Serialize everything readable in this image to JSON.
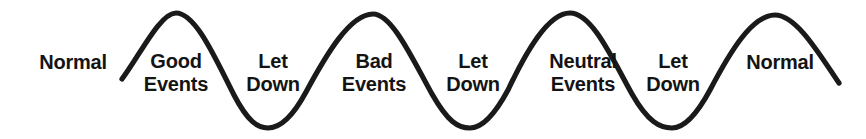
{
  "diagram": {
    "background_color": "#ffffff",
    "stroke_color": "#1a1a1a",
    "text_color": "#141414",
    "labels": [
      {
        "id": "normal-start",
        "lines": [
          "Normal"
        ],
        "x": 73,
        "y": 51,
        "position": "baseline-left"
      },
      {
        "id": "good-events",
        "lines": [
          "Good",
          "Events"
        ],
        "x": 176,
        "y": 50,
        "position": "peak-1"
      },
      {
        "id": "let-down-1",
        "lines": [
          "Let",
          "Down"
        ],
        "x": 273,
        "y": 50,
        "position": "trough-1"
      },
      {
        "id": "bad-events",
        "lines": [
          "Bad",
          "Events"
        ],
        "x": 374,
        "y": 50,
        "position": "peak-2"
      },
      {
        "id": "let-down-2",
        "lines": [
          "Let",
          "Down"
        ],
        "x": 473,
        "y": 50,
        "position": "trough-2"
      },
      {
        "id": "neutral-events",
        "lines": [
          "Neutral",
          "Events"
        ],
        "x": 583,
        "y": 50,
        "position": "peak-3"
      },
      {
        "id": "let-down-3",
        "lines": [
          "Let",
          "Down"
        ],
        "x": 673,
        "y": 50,
        "position": "trough-3"
      },
      {
        "id": "normal-end",
        "lines": [
          "Normal"
        ],
        "x": 780,
        "y": 51,
        "position": "peak-4"
      }
    ],
    "curve": {
      "type": "sine-wave",
      "peaks": 4,
      "troughs": 3,
      "start_point": [
        122,
        79
      ],
      "end_point": [
        839,
        83
      ],
      "peak_points": [
        [
          176,
          13
        ],
        [
          373,
          14
        ],
        [
          570,
          13
        ],
        [
          775,
          15
        ]
      ],
      "trough_points": [
        [
          268,
          128
        ],
        [
          470,
          128
        ],
        [
          672,
          128
        ]
      ],
      "path": "M 122 79 C 140 55, 160 13, 176 13 C 196 13, 216 60, 234 95 C 248 122, 258 128, 268 128 C 280 128, 292 118, 306 92 C 326 55, 350 14, 373 14 C 392 14, 412 58, 432 94 C 448 122, 458 128, 470 128 C 482 128, 494 116, 508 90 C 526 52, 548 13, 570 13 C 592 13, 612 58, 632 94 C 648 122, 660 128, 672 128 C 684 128, 696 116, 710 90 C 730 52, 752 15, 775 15 C 796 15, 818 52, 839 83"
    }
  }
}
